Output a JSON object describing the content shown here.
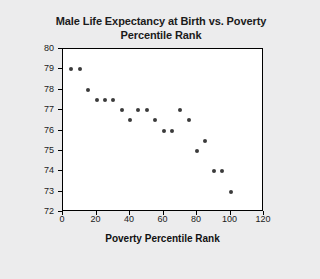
{
  "chart_data": {
    "type": "scatter",
    "title": "Male Life Expectancy at Birth vs. Poverty Percentile Rank",
    "title_line1": "Male Life Expectancy at Birth vs. Poverty",
    "title_line2": "Percentile Rank",
    "xlabel": "Poverty Percentile Rank",
    "ylabel": "Male Life Expectancy at Birth",
    "xlim": [
      0,
      120
    ],
    "ylim": [
      72,
      80
    ],
    "xticks": [
      0,
      20,
      40,
      60,
      80,
      100,
      120
    ],
    "yticks": [
      72,
      73,
      74,
      75,
      76,
      77,
      78,
      79,
      80
    ],
    "grid": false,
    "legend": false,
    "marker_color": "#3b3b3b",
    "plot_bg": "#ffffff",
    "page_bg": "#ececed",
    "points": [
      {
        "x": 5,
        "y": 79
      },
      {
        "x": 10,
        "y": 79
      },
      {
        "x": 15,
        "y": 78
      },
      {
        "x": 20,
        "y": 77.5
      },
      {
        "x": 25,
        "y": 77.5
      },
      {
        "x": 30,
        "y": 77.5
      },
      {
        "x": 35,
        "y": 77
      },
      {
        "x": 40,
        "y": 76.5
      },
      {
        "x": 45,
        "y": 77
      },
      {
        "x": 50,
        "y": 77
      },
      {
        "x": 55,
        "y": 76.5
      },
      {
        "x": 60,
        "y": 76
      },
      {
        "x": 65,
        "y": 76
      },
      {
        "x": 70,
        "y": 77
      },
      {
        "x": 75,
        "y": 76.5
      },
      {
        "x": 80,
        "y": 75
      },
      {
        "x": 85,
        "y": 75.5
      },
      {
        "x": 90,
        "y": 74
      },
      {
        "x": 95,
        "y": 74
      },
      {
        "x": 100,
        "y": 73
      }
    ]
  }
}
